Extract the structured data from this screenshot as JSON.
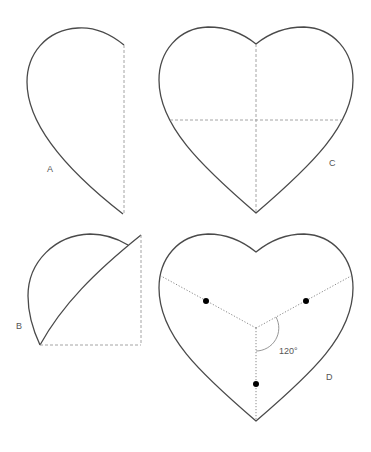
{
  "figure": {
    "panels": [
      {
        "id": "A",
        "label": "A",
        "description": "Half heart shape with dashed vertical fold line"
      },
      {
        "id": "B",
        "label": "B",
        "description": "Half heart folded along diagonal with dashed square guide"
      },
      {
        "id": "C",
        "label": "C",
        "description": "Full heart with dashed vertical and horizontal center lines"
      },
      {
        "id": "D",
        "label": "D",
        "description": "Full heart divided into three sections by dotted lines at 120 degrees with dot markers",
        "angle_label": "120°"
      }
    ]
  },
  "colors": {
    "outline": "#4a4a4a",
    "guide": "#9a9a9a",
    "dot": "#000000",
    "background": "#ffffff"
  }
}
